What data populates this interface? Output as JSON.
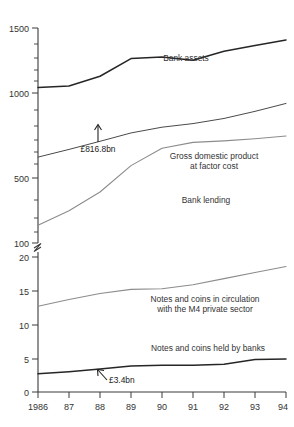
{
  "chart_data": {
    "type": "line",
    "title": "",
    "xlabel": "",
    "ylabel": "",
    "grid": false,
    "legend_position": "inline-labels",
    "axis_note": "broken y-axis: upper panel logarithmic 100-1500, lower panel linear 0-20",
    "x": [
      1986,
      1987,
      1988,
      1989,
      1990,
      1991,
      1992,
      1993,
      1994
    ],
    "categories": [
      "1986",
      "87",
      "88",
      "89",
      "90",
      "91",
      "92",
      "93",
      "94"
    ],
    "xlim": [
      1986,
      1994
    ],
    "upper_panel": {
      "scale": "log",
      "ylim": [
        100,
        1500
      ],
      "major_ticks": [
        100,
        500,
        1000,
        1500
      ],
      "major_tick_labels": [
        "100",
        "500",
        "1000",
        "1500"
      ],
      "minor_ticks": [
        200,
        300,
        400,
        600,
        700,
        800,
        900,
        1100,
        1200,
        1300,
        1400
      ]
    },
    "lower_panel": {
      "scale": "linear",
      "ylim": [
        0,
        20
      ],
      "major_ticks": [
        0,
        5,
        10,
        15,
        20
      ],
      "major_tick_labels": [
        "0",
        "5",
        "10",
        "15",
        "20"
      ]
    },
    "series": [
      {
        "name": "Bank assets",
        "panel": "upper",
        "color": "#262626",
        "label_x": 1991.0,
        "label_y": 1170,
        "values": [
          710,
          722,
          817,
          1020,
          1042,
          1000,
          1120,
          1205,
          1290
        ]
      },
      {
        "name": "Gross domestic product at factor cost",
        "panel": "upper",
        "color": "#4a4a4a",
        "label_lines": [
          "Gross domestic product",
          "at factor cost"
        ],
        "values": [
          295,
          325,
          360,
          400,
          430,
          450,
          480,
          525,
          580
        ]
      },
      {
        "name": "Bank lending",
        "panel": "upper",
        "color": "#8c8c8c",
        "values": [
          125,
          150,
          190,
          265,
          330,
          355,
          362,
          372,
          385
        ]
      },
      {
        "name": "Notes and coins in circulation with the M4 private sector",
        "panel": "lower",
        "color": "#8c8c8c",
        "label_lines": [
          "Notes and coins in circulation",
          "with the M4 private sector"
        ],
        "values": [
          12.7,
          13.7,
          14.6,
          15.2,
          15.3,
          15.9,
          16.8,
          17.7,
          18.6
        ]
      },
      {
        "name": "Notes and coins held by banks",
        "panel": "lower",
        "color": "#262626",
        "values": [
          2.7,
          3.0,
          3.4,
          3.85,
          3.95,
          3.95,
          4.1,
          4.8,
          4.9
        ]
      }
    ],
    "annotations": [
      {
        "text": "£816.8bn",
        "series": "Bank assets",
        "x": 1988,
        "value": 817,
        "arrow": "up"
      },
      {
        "text": "£3.4bn",
        "series": "Notes and coins held by banks",
        "x": 1988,
        "value": 3.4,
        "arrow": "up-left"
      }
    ]
  },
  "labels": {
    "bank_assets": "Bank assets",
    "gdp_line1": "Gross domestic product",
    "gdp_line2": "at factor cost",
    "bank_lending": "Bank lending",
    "notes_circ_line1": "Notes and coins in circulation",
    "notes_circ_line2": "with the M4 private sector",
    "notes_banks": "Notes and coins held by banks",
    "annot_bank_assets": "£816.8bn",
    "annot_notes_banks": "£3.4bn"
  },
  "y_axis": {
    "upper": [
      "1500",
      "1000",
      "500",
      "100"
    ],
    "lower": [
      "20",
      "15",
      "10",
      "5",
      "0"
    ]
  },
  "x_axis": {
    "ticks": [
      "1986",
      "87",
      "88",
      "89",
      "90",
      "91",
      "92",
      "93",
      "94"
    ]
  },
  "caption": {
    "text": ""
  }
}
